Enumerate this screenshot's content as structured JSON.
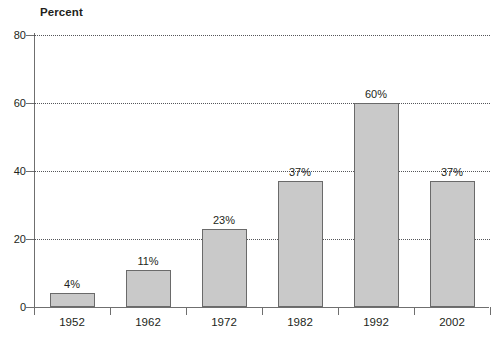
{
  "chart_data": {
    "type": "bar",
    "title": "",
    "ylabel": "Percent",
    "xlabel": "",
    "categories": [
      "1952",
      "1962",
      "1972",
      "1982",
      "1992",
      "2002"
    ],
    "values": [
      4,
      11,
      23,
      37,
      60,
      37
    ],
    "value_labels": [
      "4%",
      "11%",
      "23%",
      "37%",
      "60%",
      "37%"
    ],
    "ylim": [
      0,
      80
    ],
    "yticks": [
      0,
      20,
      40,
      60,
      80
    ],
    "ytick_labels": [
      "0",
      "20",
      "40",
      "60",
      "80"
    ],
    "grid": "horizontal-dotted",
    "legend": "none",
    "bar_color": "#c9c9c9",
    "bar_border_color": "#6a6a6a",
    "axis_color": "#6f6f6f",
    "text_color": "#231f20",
    "background": "#ffffff"
  }
}
